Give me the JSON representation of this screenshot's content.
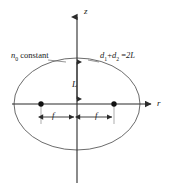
{
  "figure": {
    "background_color": "#ffffff",
    "stroke_color": "#333333",
    "text_color": "#1a1a1a"
  },
  "axes": {
    "vertical": {
      "name": "z-axis",
      "label": "z",
      "x": 77,
      "y_top": 16,
      "y_bottom": 183,
      "arrow": "up"
    },
    "horizontal": {
      "name": "r-axis",
      "label": "r",
      "y": 104,
      "x_left": 12,
      "x_right": 152,
      "arrow": "right"
    }
  },
  "ellipse": {
    "name": "constant-eta-surface",
    "center_x": 77,
    "center_y": 104,
    "semi_major_x": 63,
    "semi_minor_y": 46,
    "left_edge_x": 14,
    "right_edge_x": 140,
    "top_edge_y": 58,
    "bottom_edge_y": 150
  },
  "foci": [
    {
      "name": "focus-left",
      "x": 41,
      "y": 104,
      "radius": 2.6
    },
    {
      "name": "focus-right",
      "x": 114,
      "y": 104,
      "radius": 2.6
    }
  ],
  "annotations": {
    "eta_constant": {
      "label": "constant",
      "symbol": "n",
      "subscript": "0",
      "full_text": "n0 constant"
    },
    "distance_sum": {
      "term1": "d",
      "term1_sub": "1",
      "term2": "d",
      "term2_sub": "2",
      "operator": "+",
      "equals": "=",
      "result": "2L",
      "full_text": "d1 + d2 = 2L"
    },
    "semi_axis_L": {
      "label": "L",
      "description": "vertical double arrow from origin to ellipse top"
    },
    "focal_distance_left": {
      "label": "f",
      "description": "horizontal double arrow from left focus to origin"
    },
    "focal_distance_right": {
      "label": "f",
      "description": "horizontal double arrow from origin to right focus"
    }
  },
  "dimension_lines": {
    "L_arrow": {
      "x": 77,
      "y_top": 59,
      "y_bottom": 101
    },
    "f_left_arrow": {
      "y": 117,
      "x_start": 41,
      "x_end": 75
    },
    "f_right_arrow": {
      "y": 117,
      "x_start": 79,
      "x_end": 114
    },
    "tick_left": {
      "x": 41,
      "y_top": 104,
      "y_bottom": 123
    },
    "tick_right": {
      "x": 114,
      "y_top": 104,
      "y_bottom": 123
    }
  }
}
